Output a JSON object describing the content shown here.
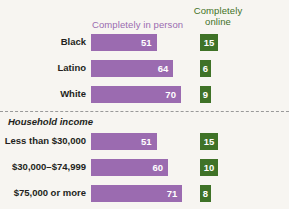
{
  "legend": {
    "in_person": "Completely in person",
    "online_line1": "Completely",
    "online_line2": "online"
  },
  "section_title": "Household income",
  "colors": {
    "purple": "#9b6bb0",
    "green": "#3f7227",
    "background": "#f7f5f1",
    "text": "#231f20",
    "divider": "#9a9a9a"
  },
  "rows": [
    {
      "label": "Black",
      "in_person": 51,
      "online": 15
    },
    {
      "label": "Latino",
      "in_person": 64,
      "online": 6
    },
    {
      "label": "White",
      "in_person": 70,
      "online": 9
    },
    {
      "label": "Less than $30,000",
      "in_person": 51,
      "online": 15
    },
    {
      "label": "$30,000–$74,999",
      "in_person": 60,
      "online": 10
    },
    {
      "label": "$75,000 or more",
      "in_person": 71,
      "online": 8
    }
  ],
  "chart_data": {
    "type": "bar",
    "title": "",
    "subtitle": "",
    "xlabel": "",
    "ylabel": "",
    "orientation": "horizontal",
    "grid": false,
    "legend_position": "top",
    "xlim": [
      0,
      100
    ],
    "groups": [
      {
        "name": "",
        "categories": [
          "Black",
          "Latino",
          "White"
        ]
      },
      {
        "name": "Household income",
        "categories": [
          "Less than $30,000",
          "$30,000–$74,999",
          "$75,000 or more"
        ]
      }
    ],
    "categories": [
      "Black",
      "Latino",
      "White",
      "Less than $30,000",
      "$30,000–$74,999",
      "$75,000 or more"
    ],
    "series": [
      {
        "name": "Completely in person",
        "color": "#9b6bb0",
        "values": [
          51,
          64,
          70,
          51,
          60,
          71
        ]
      },
      {
        "name": "Completely online",
        "color": "#3f7227",
        "values": [
          15,
          6,
          9,
          15,
          10,
          8
        ]
      }
    ]
  }
}
